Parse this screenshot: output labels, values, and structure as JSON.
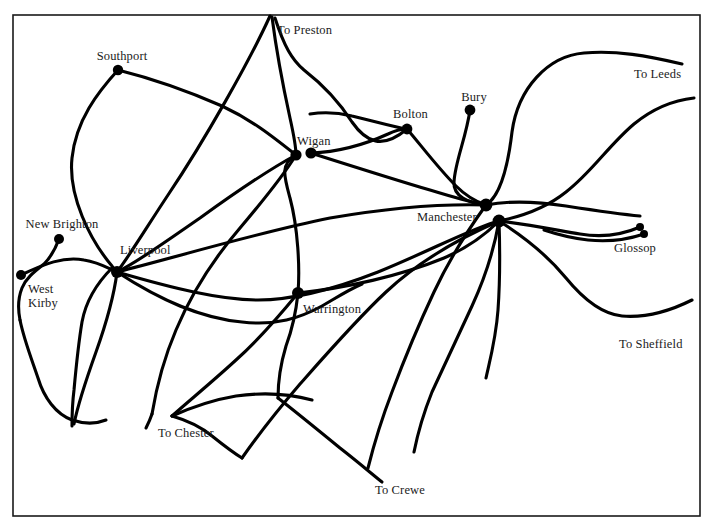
{
  "map": {
    "title": "Rail network map of the Manchester and Liverpool region",
    "background_color": "#ffffff",
    "line_color": "#000000",
    "frame_color": "#1a1a1a",
    "text_color": "#1b1b1b",
    "width": 715,
    "height": 531,
    "frame": {
      "x": 13,
      "y": 15,
      "width": 687,
      "height": 501
    },
    "stations": [
      {
        "id": "southport",
        "label": "Southport",
        "x": 118,
        "y": 70,
        "radius": 5.2,
        "label_x": 122,
        "label_y": 49,
        "anchor": "center"
      },
      {
        "id": "new-brighton",
        "label": "New Brighton",
        "x": 59,
        "y": 239,
        "radius": 5.0,
        "label_x": 62,
        "label_y": 217,
        "anchor": "center"
      },
      {
        "id": "west-kirby",
        "label": "West\nKirby",
        "x": 21,
        "y": 275,
        "radius": 5.0,
        "label_x": 28,
        "label_y": 282,
        "anchor": "start"
      },
      {
        "id": "liverpool",
        "label": "Liverpool",
        "x": 117,
        "y": 272,
        "radius": 6.0,
        "label_x": 120,
        "label_y": 243,
        "anchor": "start"
      },
      {
        "id": "wigan-west",
        "label": "",
        "x": 296,
        "y": 155,
        "radius": 5.6,
        "label_x": 0,
        "label_y": 0,
        "anchor": "start"
      },
      {
        "id": "wigan-east",
        "label": "Wigan",
        "x": 311,
        "y": 153,
        "radius": 5.6,
        "label_x": 297,
        "label_y": 134,
        "anchor": "start"
      },
      {
        "id": "bolton",
        "label": "Bolton",
        "x": 407,
        "y": 129,
        "radius": 5.4,
        "label_x": 393,
        "label_y": 107,
        "anchor": "start"
      },
      {
        "id": "bury",
        "label": "Bury",
        "x": 470,
        "y": 110,
        "radius": 5.4,
        "label_x": 474,
        "label_y": 90,
        "anchor": "center"
      },
      {
        "id": "manchester-nw",
        "label": "",
        "x": 486,
        "y": 205,
        "radius": 6.4,
        "label_x": 0,
        "label_y": 0,
        "anchor": "start"
      },
      {
        "id": "manchester-se",
        "label": "Manchester",
        "x": 499,
        "y": 221,
        "radius": 6.4,
        "label_x": 417,
        "label_y": 210,
        "anchor": "start"
      },
      {
        "id": "warrington",
        "label": "Warrington",
        "x": 298,
        "y": 293,
        "radius": 6.0,
        "label_x": 303,
        "label_y": 302,
        "anchor": "start"
      },
      {
        "id": "glossop-n",
        "label": "",
        "x": 640,
        "y": 227,
        "radius": 4.0,
        "label_x": 0,
        "label_y": 0,
        "anchor": "start"
      },
      {
        "id": "glossop-s",
        "label": "Glossop",
        "x": 644,
        "y": 234,
        "radius": 4.0,
        "label_x": 635,
        "label_y": 241,
        "anchor": "center"
      }
    ],
    "edge_labels": [
      {
        "id": "to-preston",
        "label": "To Preston",
        "x": 277,
        "y": 23,
        "anchor": "start"
      },
      {
        "id": "to-leeds",
        "label": "To Leeds",
        "x": 634,
        "y": 67,
        "anchor": "start"
      },
      {
        "id": "to-sheffield",
        "label": "To Sheffield",
        "x": 619,
        "y": 337,
        "anchor": "start"
      },
      {
        "id": "to-chester",
        "label": "To Chester",
        "x": 158,
        "y": 426,
        "anchor": "start"
      },
      {
        "id": "to-crewe",
        "label": "To Crewe",
        "x": 375,
        "y": 483,
        "anchor": "start"
      }
    ],
    "routes": [
      {
        "id": "preston-to-liverpool",
        "d": "M 270 16 C 250 60 205 140 168 195 C 150 222 128 258 117 272"
      },
      {
        "id": "preston-to-wigan",
        "d": "M 272 17 C 276 48 283 86 290 118 C 294 136 296 148 296 155"
      },
      {
        "id": "preston-to-bolton-curve",
        "d": "M 275 18 C 284 46 292 60 304 70 C 322 84 338 100 352 122 C 366 142 382 150 407 129"
      },
      {
        "id": "southport-to-wigan",
        "d": "M 118 70 C 150 78 190 92 222 106 C 252 120 272 136 296 155"
      },
      {
        "id": "southport-to-liverpool",
        "d": "M 118 70 C 98 92 76 120 72 158 C 68 196 90 240 112 266 C 114 269 116 271 117 272"
      },
      {
        "id": "wigan-to-bolton",
        "d": "M 311 153 C 338 152 366 144 388 134 C 396 130 402 129 407 129"
      },
      {
        "id": "bolton-to-manchester",
        "d": "M 407 129 C 420 144 438 168 456 186 C 468 198 480 203 486 205"
      },
      {
        "id": "bolton-west-arm",
        "d": "M 407 129 C 390 126 370 120 352 116 C 336 112 322 112 310 114"
      },
      {
        "id": "bury-to-manchester",
        "d": "M 470 110 C 466 138 455 162 454 182 C 453 196 468 203 486 205"
      },
      {
        "id": "wigan-to-manchester-upper",
        "d": "M 311 153 C 352 166 396 180 430 190 C 456 198 476 203 486 205"
      },
      {
        "id": "liverpool-to-manchester-n",
        "d": "M 117 272 C 180 256 260 232 330 218 C 400 206 454 204 486 205"
      },
      {
        "id": "liverpool-to-warrington-mcr",
        "d": "M 117 272 C 172 288 220 300 258 300 C 292 300 332 290 378 272 C 432 250 472 228 499 221"
      },
      {
        "id": "liverpool-lower-arc",
        "d": "M 117 272 C 160 300 200 318 242 322 C 276 326 300 318 322 306 C 336 298 348 290 362 284"
      },
      {
        "id": "warrington-north-spur",
        "d": "M 298 293 C 300 268 298 228 290 198 C 284 176 280 164 296 155"
      },
      {
        "id": "warrington-south-spur",
        "d": "M 298 293 C 296 312 292 330 286 346 C 280 366 278 382 278 398"
      },
      {
        "id": "warrington-to-manchester",
        "d": "M 298 293 C 346 288 400 276 444 258 C 472 246 490 230 499 221"
      },
      {
        "id": "warrington-sw-diagonal",
        "d": "M 298 293 C 276 320 256 342 236 360 C 212 382 190 400 172 416"
      },
      {
        "id": "mcr-to-leeds-upper",
        "d": "M 486 205 C 500 196 508 166 512 132 C 518 88 548 56 584 53 C 616 50 648 56 682 64"
      },
      {
        "id": "mcr-to-leeds-lower",
        "d": "M 499 221 C 524 216 546 208 566 192 C 592 172 608 146 634 124 C 656 106 676 100 694 98"
      },
      {
        "id": "mcr-to-glossop",
        "d": "M 499 221 C 526 224 556 230 580 234 C 604 238 624 234 640 227"
      },
      {
        "id": "mcr-to-sheffield",
        "d": "M 499 221 C 526 238 548 256 566 278 C 584 300 602 314 622 316 C 646 318 672 310 692 300"
      },
      {
        "id": "mcr-south-1",
        "d": "M 499 221 C 500 250 500 282 498 310 C 496 338 490 360 486 378"
      },
      {
        "id": "mcr-south-2",
        "d": "M 499 221 C 494 250 484 280 472 306 C 458 336 444 366 432 392 C 424 412 418 432 414 452"
      },
      {
        "id": "mcr-south-3",
        "d": "M 486 205 C 468 230 448 262 434 292 C 418 326 404 360 392 392 C 382 418 374 444 368 468"
      },
      {
        "id": "mcr-sw-to-chester",
        "d": "M 499 221 C 460 238 418 262 386 292 C 358 318 330 350 300 384 C 276 412 256 438 242 458"
      },
      {
        "id": "liverpool-south-1",
        "d": "M 117 272 C 114 296 106 324 96 352 C 86 380 78 404 74 424"
      },
      {
        "id": "liverpool-south-2",
        "d": "M 112 268 C 98 282 86 300 82 322 C 78 346 76 368 74 390 C 72 406 72 418 72 426"
      },
      {
        "id": "west-kirby-to-liverpool",
        "d": "M 21 275 C 44 264 64 256 84 260 C 98 262 108 268 117 272"
      },
      {
        "id": "new-brighton-spur",
        "d": "M 59 239 C 55 250 50 258 44 264 C 34 272 26 278 22 288 C 18 298 18 310 20 320"
      },
      {
        "id": "wirral-line-south",
        "d": "M 20 320 C 24 340 32 360 38 378 C 44 398 56 414 72 420 C 84 424 96 424 106 420"
      },
      {
        "id": "chester-branch",
        "d": "M 296 155 C 282 178 262 202 240 228 C 216 256 192 292 176 330 C 164 358 156 390 152 414"
      },
      {
        "id": "chester-branch-tail",
        "d": "M 152 414 C 150 420 148 424 146 428"
      },
      {
        "id": "crewe-branch",
        "d": "M 278 398 C 296 412 318 430 340 448 C 358 462 372 474 382 482"
      },
      {
        "id": "chester-arc-in",
        "d": "M 172 416 C 190 408 212 400 236 396 C 264 392 290 394 312 400"
      },
      {
        "id": "chester-to-liverpool-arc",
        "d": "M 242 458 C 232 452 222 444 212 436 C 200 426 186 420 172 416"
      },
      {
        "id": "wigan-to-liverpool-lower",
        "d": "M 296 155 C 268 170 236 192 200 218 C 168 240 138 262 117 272"
      },
      {
        "id": "mcr-far-east-arc",
        "d": "M 486 205 C 512 200 540 202 566 206 C 592 210 618 214 640 216"
      },
      {
        "id": "glossop-lower-link",
        "d": "M 644 234 C 626 240 606 242 588 240 C 570 238 556 234 544 230"
      }
    ]
  }
}
